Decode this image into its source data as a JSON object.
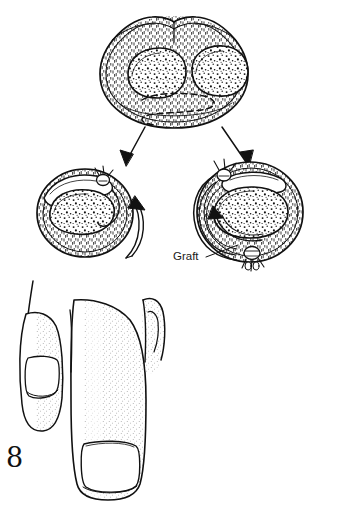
{
  "figure": {
    "number": "8",
    "domain": "surgical-illustration",
    "background_color": "#ffffff",
    "ink_color": "#111111",
    "labels": [
      {
        "id": "graft-label",
        "text": "Graft",
        "x": 173,
        "y": 251,
        "leader_from": [
          207,
          257
        ],
        "leader_to": [
          238,
          245
        ]
      }
    ],
    "panels": [
      {
        "id": "donor-cross-section",
        "name": "donor-cross-section",
        "role": "source",
        "center": [
          174,
          72
        ],
        "radius_x": 74,
        "radius_y": 56,
        "lobes": 2,
        "lobe_centers": [
          [
            152,
            68
          ],
          [
            205,
            67
          ]
        ],
        "has_dashed_incision": true,
        "texture": "stipple-hatch"
      },
      {
        "id": "recipient-left",
        "name": "recipient-left-rotated",
        "role": "rotated-flap",
        "center": [
          85,
          213
        ],
        "radius_x": 48,
        "radius_y": 44,
        "suture_count": 1,
        "rotation_arrow": "counterclockwise-up",
        "texture": "stipple-hatch"
      },
      {
        "id": "recipient-right",
        "name": "recipient-right-grafted",
        "role": "graft-inset",
        "center": [
          250,
          212
        ],
        "radius_x": 53,
        "radius_y": 50,
        "suture_count": 2,
        "rotation_arrow": "counterclockwise",
        "texture": "stipple-hatch"
      },
      {
        "id": "digit-view",
        "name": "digit-donor-site",
        "role": "clinical-view",
        "bounds": [
          14,
          278,
          165,
          500
        ],
        "digits": 3,
        "nails": 2,
        "texture": "stipple"
      }
    ],
    "arrows": [
      {
        "id": "arrow-to-left",
        "name": "transfer-arrow-left",
        "from": [
          143,
          128
        ],
        "to": [
          124,
          167
        ],
        "type": "straight"
      },
      {
        "id": "arrow-to-right",
        "name": "transfer-arrow-right",
        "from": [
          223,
          128
        ],
        "to": [
          251,
          167
        ],
        "type": "straight"
      },
      {
        "id": "arrow-rotate-left",
        "name": "rotation-arrow-left",
        "type": "curved",
        "direction": "up"
      },
      {
        "id": "arrow-rotate-right",
        "name": "rotation-arrow-right",
        "type": "curved",
        "direction": "left"
      }
    ]
  }
}
